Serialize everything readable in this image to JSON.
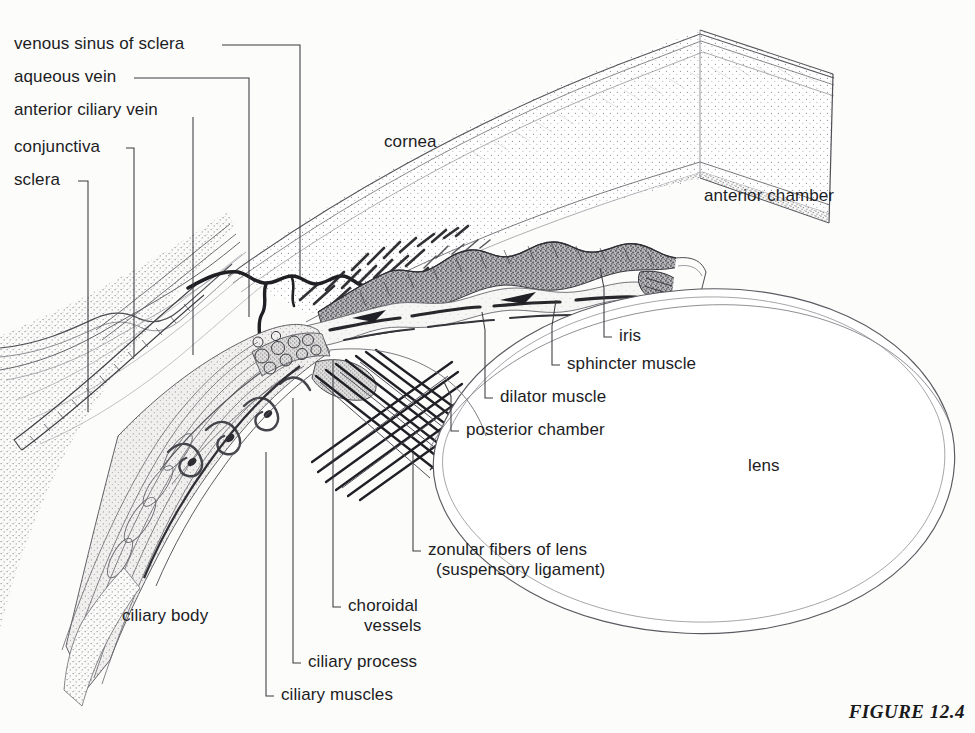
{
  "figure": {
    "caption": "FIGURE 12.4",
    "background_color": "#fcfcfb",
    "ink_color": "#1d1d1f"
  },
  "labels": {
    "left_stack": [
      {
        "id": "venous-sinus-of-sclera",
        "text": "venous sinus of sclera",
        "x": 14,
        "y": 34
      },
      {
        "id": "aqueous-vein",
        "text": "aqueous vein",
        "x": 14,
        "y": 67
      },
      {
        "id": "anterior-ciliary-vein",
        "text": "anterior ciliary vein",
        "x": 14,
        "y": 100
      },
      {
        "id": "conjunctiva",
        "text": "conjunctiva",
        "x": 14,
        "y": 137
      },
      {
        "id": "sclera",
        "text": "sclera",
        "x": 14,
        "y": 170
      }
    ],
    "right_stack": [
      {
        "id": "iris",
        "text": "iris",
        "x": 619,
        "y": 337
      },
      {
        "id": "sphincter-muscle",
        "text": "sphincter muscle",
        "x": 567,
        "y": 365
      },
      {
        "id": "dilator-muscle",
        "text": "dilator muscle",
        "x": 500,
        "y": 398
      },
      {
        "id": "posterior-chamber",
        "text": "posterior chamber",
        "x": 466,
        "y": 431
      }
    ],
    "bottom_stack": [
      {
        "id": "zonular-fibers-of-lens",
        "text": "zonular fibers of lens",
        "x": 428,
        "y": 551
      },
      {
        "id": "suspensory-ligament",
        "text": "(suspensory ligament)",
        "x": 428,
        "y": 571
      },
      {
        "id": "choroidal",
        "text": "choroidal",
        "x": 348,
        "y": 607
      },
      {
        "id": "vessels",
        "text": "vessels",
        "x": 348,
        "y": 627
      },
      {
        "id": "ciliary-process",
        "text": "ciliary process",
        "x": 308,
        "y": 663
      },
      {
        "id": "ciliary-muscles",
        "text": "ciliary muscles",
        "x": 281,
        "y": 696
      }
    ],
    "inline": [
      {
        "id": "cornea",
        "text": "cornea",
        "x": 384,
        "y": 132
      },
      {
        "id": "anterior-chamber",
        "text": "anterior chamber",
        "x": 704,
        "y": 189
      },
      {
        "id": "lens",
        "text": "lens",
        "x": 748,
        "y": 457
      },
      {
        "id": "ciliary-body",
        "text": "ciliary body",
        "x": 122,
        "y": 608
      }
    ]
  },
  "structures": {
    "cornea": "curved translucent band, stippled, cut at right edge",
    "sclera": "dense stippled wedge, lower left",
    "conjunctiva": "thin wavy membrane over sclera",
    "iris": "dark stippled undulating band with pupillary margin",
    "lens": "large ellipse with double-line capsule",
    "ciliary_body": "stippled body with folded ciliary processes",
    "zonular_fibers": "crosshatched fiber bundles from ciliary body to lens",
    "choroidal_vessels": "clustered round vessel profiles"
  }
}
